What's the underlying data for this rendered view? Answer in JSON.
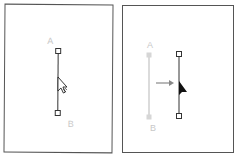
{
  "panels": [
    {
      "name": "before",
      "point_a_label": "A",
      "point_b_label": "B",
      "cursor": "selection-arrow-with-move"
    },
    {
      "name": "after",
      "point_a_label": "A",
      "point_b_label": "B",
      "cursor": "solid-arrow",
      "motion_indicator": "arrow-right"
    }
  ],
  "colors": {
    "frame": "#555555",
    "path": "#333333",
    "ghost_path": "#cfcfcf",
    "label": "#c8c8c8",
    "arrow": "#888888"
  }
}
